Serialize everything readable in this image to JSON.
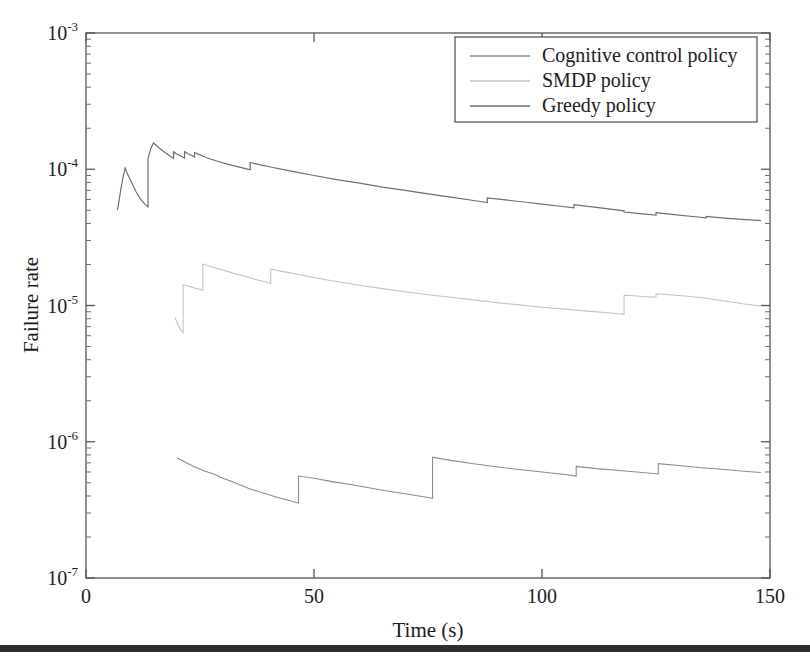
{
  "figure": {
    "background": "#ffffff",
    "scan_artifact_color": "#2f2f33"
  },
  "chart_data": {
    "type": "line",
    "title": "",
    "xlabel": "Time (s)",
    "ylabel": "Failure rate",
    "xlim": [
      0,
      150
    ],
    "ylim": [
      1e-07,
      0.001
    ],
    "yscale": "log",
    "xscale": "linear",
    "grid": false,
    "xticks": [
      0,
      50,
      100,
      150
    ],
    "xtick_labels": [
      "0",
      "50",
      "100",
      "150"
    ],
    "yticks": [
      1e-07,
      1e-06,
      1e-05,
      0.0001,
      0.001
    ],
    "ytick_labels": [
      "10",
      "10",
      "10",
      "10",
      "10"
    ],
    "ytick_exponents": [
      "-7",
      "-6",
      "-5",
      "-4",
      "-3"
    ],
    "legend_position": "upper right",
    "series": [
      {
        "name": "Cognitive control policy",
        "color": "#8c8c8c",
        "linewidth": 1.1,
        "points": [
          [
            20.0,
            7.6e-07
          ],
          [
            22.0,
            7e-07
          ],
          [
            24.0,
            6.5e-07
          ],
          [
            26.0,
            6.1e-07
          ],
          [
            28.0,
            5.8e-07
          ],
          [
            30.0,
            5.4e-07
          ],
          [
            32.0,
            5.1e-07
          ],
          [
            34.0,
            4.8e-07
          ],
          [
            36.0,
            4.5e-07
          ],
          [
            38.0,
            4.3e-07
          ],
          [
            40.0,
            4.1e-07
          ],
          [
            42.0,
            3.9e-07
          ],
          [
            44.0,
            3.75e-07
          ],
          [
            46.0,
            3.6e-07
          ],
          [
            46.6,
            3.55e-07
          ],
          [
            46.6,
            5.6e-07
          ],
          [
            50.0,
            5.4e-07
          ],
          [
            54.0,
            5.1e-07
          ],
          [
            58.0,
            4.85e-07
          ],
          [
            62.0,
            4.6e-07
          ],
          [
            66.0,
            4.35e-07
          ],
          [
            70.0,
            4.15e-07
          ],
          [
            74.0,
            3.95e-07
          ],
          [
            76.0,
            3.85e-07
          ],
          [
            76.0,
            7.7e-07
          ],
          [
            80.0,
            7.3e-07
          ],
          [
            85.0,
            6.9e-07
          ],
          [
            90.0,
            6.55e-07
          ],
          [
            95.0,
            6.25e-07
          ],
          [
            100.0,
            6e-07
          ],
          [
            105.0,
            5.75e-07
          ],
          [
            107.5,
            5.6e-07
          ],
          [
            107.5,
            6.6e-07
          ],
          [
            112.0,
            6.35e-07
          ],
          [
            117.0,
            6.15e-07
          ],
          [
            122.0,
            5.95e-07
          ],
          [
            125.5,
            5.8e-07
          ],
          [
            125.5,
            6.9e-07
          ],
          [
            130.0,
            6.7e-07
          ],
          [
            135.0,
            6.45e-07
          ],
          [
            140.0,
            6.25e-07
          ],
          [
            145.0,
            6.05e-07
          ],
          [
            148.0,
            5.95e-07
          ]
        ]
      },
      {
        "name": "SMDP policy",
        "color": "#c4c4c4",
        "linewidth": 1.1,
        "points": [
          [
            19.5,
            8.2e-06
          ],
          [
            20.2,
            7.2e-06
          ],
          [
            20.8,
            6.6e-06
          ],
          [
            21.3,
            6.3e-06
          ],
          [
            21.3,
            1.42e-05
          ],
          [
            22.0,
            1.4e-05
          ],
          [
            23.0,
            1.37e-05
          ],
          [
            24.0,
            1.34e-05
          ],
          [
            25.0,
            1.31e-05
          ],
          [
            25.6,
            1.29e-05
          ],
          [
            25.6,
            2.02e-05
          ],
          [
            27.0,
            1.95e-05
          ],
          [
            29.0,
            1.86e-05
          ],
          [
            31.0,
            1.78e-05
          ],
          [
            33.0,
            1.7e-05
          ],
          [
            35.0,
            1.63e-05
          ],
          [
            37.0,
            1.56e-05
          ],
          [
            39.0,
            1.5e-05
          ],
          [
            40.5,
            1.45e-05
          ],
          [
            40.5,
            1.85e-05
          ],
          [
            43.0,
            1.78e-05
          ],
          [
            47.0,
            1.68e-05
          ],
          [
            51.0,
            1.58e-05
          ],
          [
            55.0,
            1.5e-05
          ],
          [
            60.0,
            1.41e-05
          ],
          [
            65.0,
            1.33e-05
          ],
          [
            70.0,
            1.26e-05
          ],
          [
            75.0,
            1.2e-05
          ],
          [
            80.0,
            1.15e-05
          ],
          [
            85.0,
            1.1e-05
          ],
          [
            90.0,
            1.05e-05
          ],
          [
            95.0,
            1.01e-05
          ],
          [
            100.0,
            9.7e-06
          ],
          [
            105.0,
            9.4e-06
          ],
          [
            110.0,
            9.1e-06
          ],
          [
            115.0,
            8.8e-06
          ],
          [
            118.0,
            8.6e-06
          ],
          [
            118.0,
            1.19e-05
          ],
          [
            120.0,
            1.18e-05
          ],
          [
            123.0,
            1.16e-05
          ],
          [
            125.0,
            1.15e-05
          ],
          [
            125.0,
            1.22e-05
          ],
          [
            128.0,
            1.2e-05
          ],
          [
            132.0,
            1.17e-05
          ],
          [
            136.0,
            1.13e-05
          ],
          [
            140.0,
            1.08e-05
          ],
          [
            144.0,
            1.03e-05
          ],
          [
            148.0,
            9.9e-06
          ]
        ]
      },
      {
        "name": "Greedy policy",
        "color": "#6e6e6e",
        "linewidth": 1.2,
        "points": [
          [
            6.8,
            5e-05
          ],
          [
            7.0,
            5.2e-05
          ],
          [
            7.6,
            7e-05
          ],
          [
            8.2,
            9e-05
          ],
          [
            8.6,
            0.000102
          ],
          [
            9.0,
            9.4e-05
          ],
          [
            10.0,
            8e-05
          ],
          [
            11.0,
            6.8e-05
          ],
          [
            12.0,
            6e-05
          ],
          [
            13.0,
            5.5e-05
          ],
          [
            13.6,
            5.3e-05
          ],
          [
            13.6,
            0.00012
          ],
          [
            14.2,
            0.000142
          ],
          [
            14.8,
            0.000156
          ],
          [
            15.4,
            0.00015
          ],
          [
            16.4,
            0.00014
          ],
          [
            17.4,
            0.000132
          ],
          [
            18.4,
            0.000125
          ],
          [
            19.2,
            0.00012
          ],
          [
            19.2,
            0.000134
          ],
          [
            20.0,
            0.000129
          ],
          [
            21.0,
            0.000124
          ],
          [
            21.6,
            0.000121
          ],
          [
            21.6,
            0.000135
          ],
          [
            22.4,
            0.00013
          ],
          [
            23.2,
            0.000126
          ],
          [
            23.8,
            0.000123
          ],
          [
            23.8,
            0.000133
          ],
          [
            24.6,
            0.000129
          ],
          [
            25.6,
            0.000125
          ],
          [
            26.6,
            0.000121
          ],
          [
            27.6,
            0.000118
          ],
          [
            29.0,
            0.000114
          ],
          [
            31.0,
            0.000109
          ],
          [
            33.0,
            0.000105
          ],
          [
            35.0,
            0.000101
          ],
          [
            36.0,
            9.9e-05
          ],
          [
            36.0,
            0.000112
          ],
          [
            38.0,
            0.000108
          ],
          [
            41.0,
            0.000103
          ],
          [
            45.0,
            9.7e-05
          ],
          [
            50.0,
            9e-05
          ],
          [
            55.0,
            8.4e-05
          ],
          [
            60.0,
            7.9e-05
          ],
          [
            65.0,
            7.4e-05
          ],
          [
            70.0,
            7e-05
          ],
          [
            75.0,
            6.6e-05
          ],
          [
            80.0,
            6.25e-05
          ],
          [
            85.0,
            5.9e-05
          ],
          [
            88.0,
            5.7e-05
          ],
          [
            88.0,
            6.15e-05
          ],
          [
            92.0,
            5.95e-05
          ],
          [
            96.0,
            5.75e-05
          ],
          [
            100.0,
            5.55e-05
          ],
          [
            104.0,
            5.35e-05
          ],
          [
            107.0,
            5.2e-05
          ],
          [
            107.0,
            5.5e-05
          ],
          [
            111.0,
            5.3e-05
          ],
          [
            115.0,
            5.1e-05
          ],
          [
            118.0,
            4.95e-05
          ],
          [
            118.0,
            4.85e-05
          ],
          [
            122.0,
            4.7e-05
          ],
          [
            125.0,
            4.6e-05
          ],
          [
            125.0,
            4.8e-05
          ],
          [
            129.0,
            4.65e-05
          ],
          [
            133.0,
            4.5e-05
          ],
          [
            136.0,
            4.4e-05
          ],
          [
            136.0,
            4.5e-05
          ],
          [
            140.0,
            4.38e-05
          ],
          [
            144.0,
            4.28e-05
          ],
          [
            148.0,
            4.2e-05
          ]
        ]
      }
    ]
  },
  "legend": {
    "entries": [
      {
        "label": "Cognitive control policy",
        "color": "#8c8c8c"
      },
      {
        "label": "SMDP policy",
        "color": "#c4c4c4"
      },
      {
        "label": "Greedy policy",
        "color": "#6e6e6e"
      }
    ]
  },
  "axes": {
    "y_title": "Failure rate",
    "x_title": "Time (s)"
  }
}
